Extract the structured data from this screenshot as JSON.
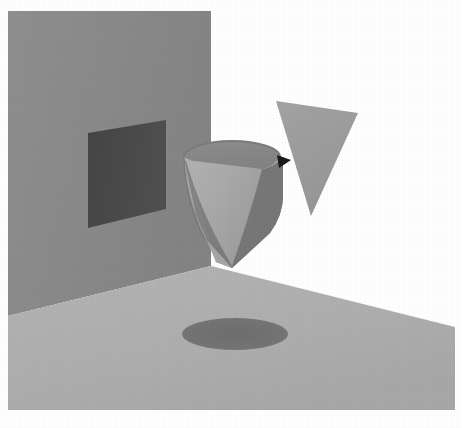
{
  "image": {
    "title": "3D shapes scene",
    "width": 462,
    "height": 428,
    "background_color": "#ffffff",
    "style": "grayscale rendered 3D geometric scene"
  },
  "palette": {
    "background": "#ffffff",
    "wall": "#8a8a8a",
    "floor": "#b0b0b0",
    "wall_panel_dark": "#4a4a4a",
    "floor_shadow": "#737373",
    "cone_outer": "#7e7e7e",
    "cone_inner_light": "#ababab",
    "cone_rim_top": "#878787",
    "triangle": "#9d9d9d",
    "notch_black": "#1a1a1a",
    "cone_edge_dark": "#6d6d6d"
  },
  "objects": [
    {
      "id": "back-wall",
      "name": "back wall plane",
      "shape": "quadrilateral",
      "fill": "#8a8a8a",
      "points": "8,11 211,11 211,266 8,316",
      "description": "Large vertical gray wall occupying the upper-left of the frame"
    },
    {
      "id": "floor",
      "name": "floor plane",
      "shape": "quadrilateral",
      "fill": "#b0b0b0",
      "points": "8,316 211,266 455,327 455,410 8,410",
      "description": "Light gray ground plane receding to the right"
    },
    {
      "id": "wall-panel",
      "name": "dark panel on wall",
      "shape": "quadrilateral",
      "fill": "#4a4a4a",
      "points": "88,133 166,120 166,209 88,228",
      "description": "Dark rectangular panel (window or shadow) set into the wall"
    },
    {
      "id": "floor-shadow",
      "name": "elliptical shadow on floor",
      "shape": "ellipse",
      "fill": "#737373",
      "cx": 235,
      "cy": 334,
      "rx": 53,
      "ry": 16,
      "description": "Dark ellipse cast on the floor beneath the cone"
    },
    {
      "id": "cone-body",
      "name": "open cone outer surface",
      "shape": "cone",
      "fill": "#7e7e7e",
      "description": "Large open cone / funnel with elliptical top rim, apex pointing down-left"
    },
    {
      "id": "cone-interior",
      "name": "cone inner surface",
      "shape": "cone-interior",
      "fill": "#ababab",
      "description": "Lit inner wall of the cone visible through the open top"
    },
    {
      "id": "cone-rim",
      "name": "cone top rim ellipse",
      "shape": "ellipse",
      "fill": "#878787",
      "cx": 232,
      "cy": 157,
      "rx": 48,
      "ry": 16,
      "description": "Elliptical opening at the top of the cone"
    },
    {
      "id": "triangle-cone",
      "name": "inverted triangular cone",
      "shape": "triangle",
      "fill": "#9d9d9d",
      "points": "276,101 358,113 311,216",
      "description": "Inverted cone rendered as a downward-pointing triangle at upper right"
    },
    {
      "id": "contact-notch",
      "name": "dark contact notch",
      "shape": "triangle",
      "fill": "#1a1a1a",
      "points": "277,155 291,160 279,168",
      "description": "Small black wedge where the triangle meets the cone rim"
    }
  ],
  "labels": {
    "scene_name": "Grayscale geometric render",
    "object_count": "5"
  }
}
